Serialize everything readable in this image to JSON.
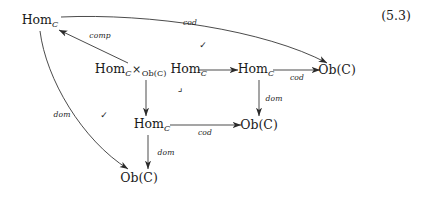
{
  "equation": {
    "number": "(5.3)"
  },
  "nodes": [
    {
      "id": "hom-top-left",
      "label": "Hom",
      "subscript": "C",
      "x": 40,
      "y": 21
    },
    {
      "id": "hom-product",
      "label": "Hom",
      "subscript": "C",
      "x": 151,
      "y": 70
    },
    {
      "id": "hom-mid-right",
      "label": "Hom",
      "subscript": "C",
      "x": 256,
      "y": 70
    },
    {
      "id": "ob-far-right",
      "label": "Ob(C)",
      "subscript": "",
      "x": 337,
      "y": 70
    },
    {
      "id": "hom-lower-center",
      "label": "Hom",
      "subscript": "C",
      "x": 152,
      "y": 125
    },
    {
      "id": "ob-lower-right",
      "label": "Ob(C)",
      "subscript": "",
      "x": 259,
      "y": 125
    },
    {
      "id": "ob-bottom-left",
      "label": "Ob(C)",
      "subscript": "",
      "x": 139,
      "y": 178
    }
  ],
  "product_node": {
    "left": "Hom",
    "left_sub": "C",
    "operator": "×",
    "operator_sub": "Ob(C)",
    "right": "Hom",
    "right_sub": "C"
  },
  "arrows": [
    {
      "id": "cod-curved-top",
      "label": "cod",
      "label_x": 190,
      "label_y": 23
    },
    {
      "id": "comp-diagonal",
      "label": "comp",
      "label_x": 100,
      "label_y": 36
    },
    {
      "id": "dom-curved-left",
      "label": "dom",
      "label_x": 62,
      "label_y": 115
    },
    {
      "id": "product-to-hom",
      "label": "",
      "label_x": 0,
      "label_y": 0
    },
    {
      "id": "hom-to-ob-cod-top",
      "label": "cod",
      "label_x": 297,
      "label_y": 78
    },
    {
      "id": "product-down",
      "label": "",
      "label_x": 0,
      "label_y": 0
    },
    {
      "id": "hom-down-dom-right",
      "label": "dom",
      "label_x": 274,
      "label_y": 99
    },
    {
      "id": "hom-to-ob-cod-low",
      "label": "cod",
      "label_x": 205,
      "label_y": 133
    },
    {
      "id": "hom-down-dom-low",
      "label": "dom",
      "label_x": 166,
      "label_y": 153
    }
  ],
  "markers": {
    "check_upper": {
      "symbol": "✓",
      "x": 203,
      "y": 45
    },
    "check_lower": {
      "symbol": "✓",
      "x": 104,
      "y": 115
    },
    "pullback_corner": {
      "symbol": "⌟",
      "x": 180,
      "y": 88
    }
  },
  "style": {
    "stroke_color": "#2b2b2b",
    "text_color": "#1a1a1a",
    "background": "#ffffff"
  }
}
